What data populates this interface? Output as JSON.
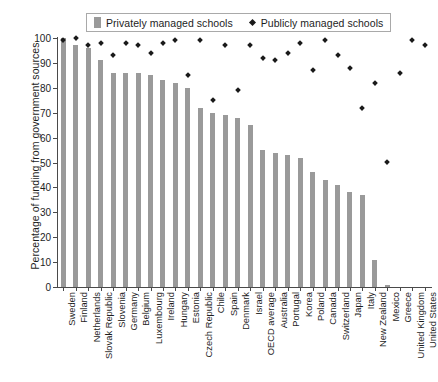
{
  "chart_data": {
    "type": "bar",
    "title": "",
    "xlabel": "",
    "ylabel": "Percentage of funding from government sources",
    "ylim": [
      0,
      100
    ],
    "yticks": [
      0,
      10,
      20,
      30,
      40,
      50,
      60,
      70,
      80,
      90,
      100
    ],
    "grid": false,
    "legend_position": "top",
    "categories": [
      "Sweden",
      "Finland",
      "Netherlands",
      "Slovak Republic",
      "Slovenia",
      "Germany",
      "Belgium",
      "Luxembourg",
      "Ireland",
      "Hungary",
      "Estonia",
      "Czech Republic",
      "Chile",
      "Spain",
      "Denmark",
      "Israel",
      "OECD average",
      "Australia",
      "Portugal",
      "Korea",
      "Poland",
      "Canada",
      "Switzerland",
      "Japan",
      "Italy",
      "New Zealand",
      "Mexico",
      "Greece",
      "United Kingdom",
      "United States"
    ],
    "series": [
      {
        "name": "Privately managed schools",
        "type": "bar",
        "color": "#9a9a9a",
        "values": [
          100,
          97,
          96,
          91,
          86,
          86,
          86,
          85,
          83,
          82,
          80,
          72,
          70,
          69,
          68,
          65,
          55,
          54,
          53,
          52,
          46,
          43,
          41,
          38,
          37,
          11,
          1,
          null,
          null,
          null
        ]
      },
      {
        "name": "Publicly managed schools",
        "type": "scatter",
        "marker": "diamond",
        "color": "#1a1a1a",
        "values": [
          99,
          100,
          97,
          98,
          93,
          98,
          97,
          94,
          98,
          99,
          85,
          99,
          75,
          97,
          79,
          97,
          92,
          91,
          94,
          98,
          87,
          99,
          93,
          88,
          72,
          82,
          50,
          86,
          99,
          97
        ]
      }
    ]
  },
  "legend": {
    "items": [
      {
        "label": "Privately managed schools",
        "marker": "bar-swatch"
      },
      {
        "label": "Publicly managed schools",
        "marker": "diamond-marker"
      }
    ]
  },
  "axes": {
    "y_title": "Percentage of funding from government sources",
    "y_tick_labels": [
      "100",
      "90",
      "80",
      "70",
      "60",
      "50",
      "40",
      "30",
      "20",
      "10",
      "0"
    ]
  }
}
